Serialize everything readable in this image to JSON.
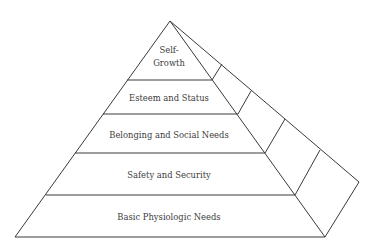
{
  "diagram": {
    "type": "pyramid",
    "title": "",
    "levels": [
      {
        "id": "self-growth",
        "lines": [
          "Self-",
          "Growth"
        ]
      },
      {
        "id": "esteem",
        "lines": [
          "Esteem and Status"
        ]
      },
      {
        "id": "belonging",
        "lines": [
          "Belonging and Social Needs"
        ]
      },
      {
        "id": "safety",
        "lines": [
          "Safety and Security"
        ]
      },
      {
        "id": "physiologic",
        "lines": [
          "Basic Physiologic Needs"
        ]
      }
    ],
    "colors": {
      "stroke": "#3a3a3a",
      "text": "#3c3c3c",
      "background": "#ffffff"
    }
  }
}
